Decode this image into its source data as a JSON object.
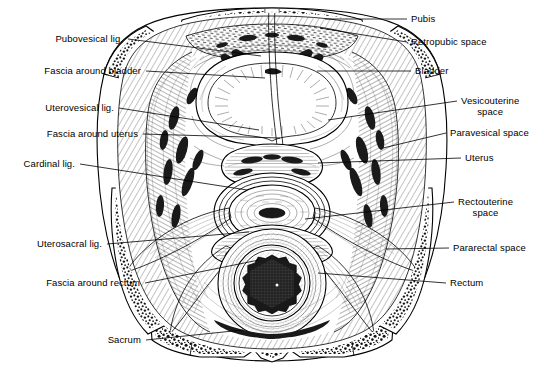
{
  "figure": {
    "line_color": "#000000",
    "background_color": "#ffffff",
    "text_color": "#000000"
  },
  "labels_left": [
    {
      "id": "pubovesical-lig",
      "text": "Pubovesical lig.",
      "x": 37,
      "y": 39,
      "lx": 128,
      "ly": 39,
      "ex": 261,
      "ey": 56
    },
    {
      "id": "fascia-around-bladder",
      "text": "Fascia around bladder",
      "x": 24,
      "y": 71,
      "lx": 146,
      "ly": 71,
      "ex": 265,
      "ey": 78
    },
    {
      "id": "uterovesical-lig",
      "text": "Uterovesical lig.",
      "x": 27,
      "y": 108,
      "lx": 119,
      "ly": 108,
      "ex": 259,
      "ey": 130
    },
    {
      "id": "fascia-around-uterus",
      "text": "Fascia around uterus",
      "x": 20,
      "y": 134,
      "lx": 143,
      "ly": 134,
      "ex": 280,
      "ey": 138
    },
    {
      "id": "cardinal-lig",
      "text": "Cardinal lig.",
      "x": 10,
      "y": 164,
      "lx": 80,
      "ly": 164,
      "ex": 247,
      "ey": 190
    },
    {
      "id": "uterosacral-lig",
      "text": "Uterosacral lig.",
      "x": 17,
      "y": 244,
      "lx": 107,
      "ly": 244,
      "ex": 249,
      "ey": 232
    },
    {
      "id": "fascia-around-rectum",
      "text": "Fascia around rectum",
      "x": 22,
      "y": 283,
      "lx": 145,
      "ly": 283,
      "ex": 259,
      "ey": 260
    },
    {
      "id": "sacrum",
      "text": "Sacrum",
      "x": 100,
      "y": 340,
      "lx": 146,
      "ly": 340,
      "ex": 243,
      "ey": 330
    }
  ],
  "labels_right": [
    {
      "id": "pubis",
      "text": "Pubis",
      "line2": "",
      "x": 411,
      "y": 19,
      "lx": 407,
      "ly": 19,
      "ex": 325,
      "ey": 19
    },
    {
      "id": "retropubic-space",
      "text": "Retropubic space",
      "line2": "",
      "x": 411,
      "y": 42,
      "lx": 407,
      "ly": 42,
      "ex": 320,
      "ey": 28
    },
    {
      "id": "bladder",
      "text": "Bladder",
      "line2": "",
      "x": 415,
      "y": 71,
      "lx": 411,
      "ly": 71,
      "ex": 317,
      "ey": 71
    },
    {
      "id": "vesicouterine-space",
      "text": "Vesicouterine",
      "line2": "space",
      "x": 461,
      "y": 101,
      "lx": 457,
      "ly": 101,
      "ex": 328,
      "ey": 120
    },
    {
      "id": "paravesical-space",
      "text": "Paravesical space",
      "line2": "",
      "x": 450,
      "y": 133,
      "lx": 446,
      "ly": 133,
      "ex": 383,
      "ey": 148
    },
    {
      "id": "uterus",
      "text": "Uterus",
      "line2": "",
      "x": 465,
      "y": 158,
      "lx": 461,
      "ly": 158,
      "ex": 318,
      "ey": 163
    },
    {
      "id": "rectouterine-space",
      "text": "Rectouterine",
      "line2": "space",
      "x": 458,
      "y": 202,
      "lx": 454,
      "ly": 202,
      "ex": 305,
      "ey": 219
    },
    {
      "id": "pararectal-space",
      "text": "Pararectal space",
      "line2": "",
      "x": 453,
      "y": 248,
      "lx": 449,
      "ly": 248,
      "ex": 386,
      "ey": 249
    },
    {
      "id": "rectum",
      "text": "Rectum",
      "line2": "",
      "x": 450,
      "y": 283,
      "lx": 446,
      "ly": 283,
      "ex": 318,
      "ey": 273
    }
  ]
}
